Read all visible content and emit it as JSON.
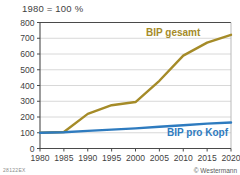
{
  "chart_data": {
    "type": "line",
    "title": "1980 = 100 %",
    "xlabel": "",
    "ylabel": "",
    "xlim": [
      1980,
      2020
    ],
    "ylim": [
      0,
      800
    ],
    "grid": true,
    "legend_position": "inline-annotations",
    "x": [
      1980,
      1985,
      1990,
      1995,
      2000,
      2005,
      2010,
      2015,
      2020
    ],
    "xticks": [
      "1980",
      "1985",
      "1990",
      "1995",
      "2000",
      "2005",
      "2010",
      "2015",
      "2020"
    ],
    "yticks": [
      "0",
      "100",
      "200",
      "300",
      "400",
      "500",
      "600",
      "700",
      "800"
    ],
    "series": [
      {
        "name": "BIP gesamt",
        "color": "#a58b28",
        "values": [
          100,
          105,
          220,
          275,
          295,
          430,
          590,
          672,
          722
        ]
      },
      {
        "name": "BIP pro Kopf",
        "color": "#2e7bbf",
        "values": [
          100,
          103,
          112,
          120,
          128,
          138,
          148,
          158,
          165
        ]
      }
    ]
  },
  "annotations": {
    "gesamt_label": "BIP gesamt",
    "pro_kopf_label": "BIP pro Kopf"
  },
  "footer": {
    "credit": "© Westermann",
    "reference_code": "28122EX"
  }
}
